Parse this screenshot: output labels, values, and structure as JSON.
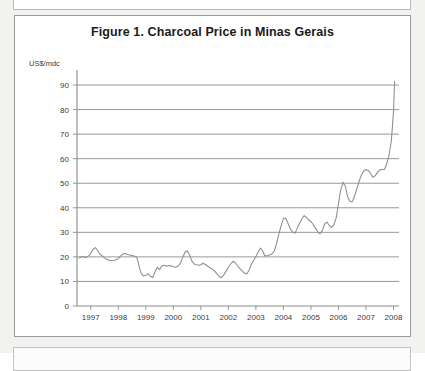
{
  "figure": {
    "title": "Figure 1. Charcoal Price in Minas Gerais",
    "axis_unit_label": "US$/mdc"
  },
  "chart_data": {
    "type": "line",
    "title": "Figure 1. Charcoal Price in Minas Gerais",
    "xlabel": "",
    "ylabel": "US$/mdc",
    "ylim": [
      0,
      90
    ],
    "xlim": [
      1996.5,
      2008.2
    ],
    "yticks": [
      0,
      10,
      20,
      30,
      40,
      50,
      60,
      70,
      80,
      90
    ],
    "ytick_labels": [
      "0",
      "10",
      "20",
      "30",
      "40",
      "50",
      "60",
      "70",
      "80",
      "90"
    ],
    "xticks": [
      1997,
      1998,
      1999,
      2000,
      2001,
      2002,
      2003,
      2004,
      2005,
      2006,
      2007,
      2008
    ],
    "xtick_labels": [
      "1997",
      "1998",
      "1999",
      "2000",
      "2001",
      "2002",
      "2003",
      "2004",
      "2005",
      "2006",
      "2007",
      "2008"
    ],
    "grid": "horizontal",
    "legend": "none",
    "line_color": "#8c8c8c",
    "series": [
      {
        "name": "Charcoal price",
        "x": [
          1996.58,
          1996.67,
          1996.75,
          1996.83,
          1996.92,
          1997.0,
          1997.08,
          1997.17,
          1997.25,
          1997.33,
          1997.42,
          1997.5,
          1997.58,
          1997.67,
          1997.75,
          1997.83,
          1997.92,
          1998.0,
          1998.08,
          1998.17,
          1998.25,
          1998.33,
          1998.42,
          1998.5,
          1998.58,
          1998.67,
          1998.75,
          1998.83,
          1998.92,
          1999.0,
          1999.08,
          1999.17,
          1999.25,
          1999.33,
          1999.42,
          1999.5,
          1999.58,
          1999.67,
          1999.75,
          1999.83,
          1999.92,
          2000.0,
          2000.08,
          2000.17,
          2000.25,
          2000.33,
          2000.42,
          2000.5,
          2000.58,
          2000.67,
          2000.75,
          2000.83,
          2000.92,
          2001.0,
          2001.08,
          2001.17,
          2001.25,
          2001.33,
          2001.42,
          2001.5,
          2001.58,
          2001.67,
          2001.75,
          2001.83,
          2001.92,
          2002.0,
          2002.08,
          2002.17,
          2002.25,
          2002.33,
          2002.42,
          2002.5,
          2002.58,
          2002.67,
          2002.75,
          2002.83,
          2002.92,
          2003.0,
          2003.08,
          2003.17,
          2003.25,
          2003.33,
          2003.42,
          2003.5,
          2003.58,
          2003.67,
          2003.75,
          2003.83,
          2003.92,
          2004.0,
          2004.08,
          2004.17,
          2004.25,
          2004.33,
          2004.42,
          2004.5,
          2004.58,
          2004.67,
          2004.75,
          2004.83,
          2004.92,
          2005.0,
          2005.08,
          2005.17,
          2005.25,
          2005.33,
          2005.42,
          2005.5,
          2005.58,
          2005.67,
          2005.75,
          2005.83,
          2005.92,
          2006.0,
          2006.08,
          2006.17,
          2006.25,
          2006.33,
          2006.42,
          2006.5,
          2006.58,
          2006.67,
          2006.75,
          2006.83,
          2006.92,
          2007.0,
          2007.08,
          2007.17,
          2007.25,
          2007.33,
          2007.42,
          2007.5,
          2007.58,
          2007.67,
          2007.75,
          2007.83,
          2007.92,
          2008.0,
          2008.04
        ],
        "values": [
          19.5,
          20.2,
          20.0,
          19.8,
          20.4,
          21.5,
          23.0,
          23.8,
          22.6,
          21.2,
          20.4,
          19.6,
          19.0,
          18.6,
          18.4,
          18.5,
          18.8,
          19.4,
          20.3,
          21.2,
          21.4,
          21.0,
          20.8,
          20.6,
          20.4,
          19.9,
          16.5,
          13.3,
          12.2,
          12.5,
          13.2,
          12.0,
          11.6,
          13.8,
          15.8,
          14.8,
          16.3,
          16.6,
          16.2,
          16.5,
          16.4,
          16.0,
          15.8,
          16.2,
          17.2,
          19.5,
          21.8,
          22.5,
          21.0,
          18.4,
          17.2,
          16.8,
          16.6,
          16.8,
          17.4,
          16.8,
          16.2,
          15.6,
          15.0,
          14.2,
          13.2,
          12.0,
          11.5,
          12.6,
          14.2,
          15.8,
          17.0,
          18.2,
          17.6,
          16.4,
          15.2,
          14.3,
          13.4,
          13.0,
          14.6,
          16.8,
          18.6,
          20.2,
          22.0,
          23.6,
          22.3,
          20.4,
          20.6,
          20.8,
          21.2,
          22.4,
          25.4,
          29.2,
          32.8,
          35.6,
          35.8,
          33.6,
          31.4,
          30.2,
          29.6,
          31.6,
          33.6,
          35.4,
          36.8,
          36.2,
          35.0,
          34.4,
          33.2,
          31.6,
          30.2,
          29.4,
          30.8,
          33.4,
          34.2,
          32.8,
          32.0,
          33.0,
          36.0,
          41.6,
          47.2,
          50.4,
          48.8,
          44.6,
          42.6,
          42.4,
          44.6,
          47.8,
          50.8,
          53.2,
          55.0,
          55.6,
          55.2,
          54.0,
          52.4,
          53.0,
          54.4,
          55.4,
          55.6,
          55.6,
          57.8,
          61.0,
          67.0,
          79.0,
          91.5
        ]
      }
    ]
  }
}
